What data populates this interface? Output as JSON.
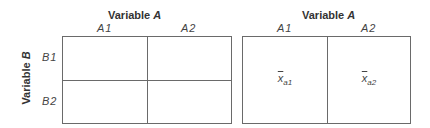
{
  "left_table": {
    "column_variable": {
      "name": "Variable",
      "symbol": "A"
    },
    "row_variable": {
      "name": "Variable",
      "symbol": "B"
    },
    "columns": [
      "A1",
      "A2"
    ],
    "rows": [
      "B1",
      "B2"
    ],
    "cells": [
      [
        "",
        ""
      ],
      [
        "",
        ""
      ]
    ]
  },
  "right_table": {
    "column_variable": {
      "name": "Variable",
      "symbol": "A"
    },
    "columns": [
      "A1",
      "A2"
    ],
    "cells": [
      {
        "symbol": "x",
        "subscript": "a1"
      },
      {
        "symbol": "x",
        "subscript": "a2"
      }
    ]
  },
  "colors": {
    "line": "#6a6a6a",
    "text": "#333333",
    "background": "#ffffff"
  }
}
